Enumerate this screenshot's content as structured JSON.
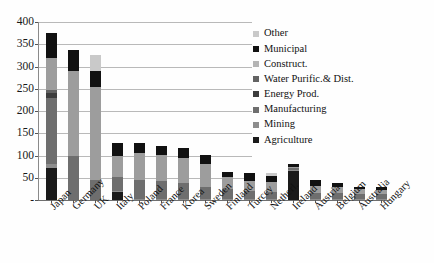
{
  "chart_data": {
    "type": "bar",
    "subtype": "stacked-bar",
    "title": "",
    "xlabel": "",
    "ylabel": "",
    "ylim": [
      0,
      400
    ],
    "ytick_step": 50,
    "yticks": [
      "400",
      "350",
      "300",
      "250",
      "200",
      "150",
      "100",
      "50",
      "-"
    ],
    "grid": true,
    "legend_position": "right",
    "categories": [
      "Japan",
      "Germany",
      "UK",
      "Italy",
      "Poland",
      "France",
      "Korea",
      "Sweden",
      "Finland",
      "Turcey",
      "Netherl.",
      "Ireland",
      "Austria",
      "Belgium",
      "Australia",
      "Hungary"
    ],
    "series": [
      {
        "name": "Agriculture",
        "color": "#1a1a1a",
        "values": [
          72,
          0,
          0,
          18,
          0,
          0,
          0,
          0,
          0,
          0,
          0,
          66,
          0,
          0,
          0,
          0
        ]
      },
      {
        "name": "Mining",
        "color": "#8d8d8d",
        "values": [
          8,
          0,
          0,
          2,
          2,
          2,
          2,
          2,
          2,
          2,
          2,
          2,
          2,
          2,
          2,
          2
        ]
      },
      {
        "name": "Manufacturing",
        "color": "#6e6e6e",
        "values": [
          150,
          100,
          45,
          32,
          42,
          40,
          36,
          28,
          22,
          18,
          16,
          4,
          14,
          14,
          12,
          12
        ]
      },
      {
        "name": "Energy Prod.",
        "color": "#3d3d3d",
        "values": [
          10,
          0,
          0,
          0,
          0,
          0,
          0,
          0,
          0,
          0,
          0,
          0,
          0,
          0,
          0,
          0
        ]
      },
      {
        "name": "Water Purific.& Dist.",
        "color": "#636363",
        "values": [
          8,
          0,
          0,
          0,
          0,
          0,
          0,
          0,
          0,
          0,
          0,
          0,
          0,
          0,
          0,
          0
        ]
      },
      {
        "name": "Construct.",
        "color": "#9d9d9d",
        "values": [
          72,
          190,
          210,
          48,
          62,
          60,
          56,
          50,
          28,
          22,
          22,
          2,
          16,
          14,
          10,
          8
        ]
      },
      {
        "name": "Municipal",
        "color": "#111111",
        "values": [
          55,
          48,
          35,
          28,
          22,
          20,
          24,
          22,
          12,
          18,
          14,
          6,
          12,
          8,
          6,
          8
        ]
      },
      {
        "name": "Other",
        "color": "#c9c9c9",
        "values": [
          0,
          0,
          35,
          0,
          0,
          0,
          0,
          0,
          0,
          0,
          6,
          0,
          0,
          0,
          0,
          0
        ]
      }
    ],
    "totals": [
      375,
      338,
      325,
      128,
      128,
      122,
      118,
      102,
      64,
      60,
      60,
      80,
      44,
      38,
      30,
      30
    ]
  },
  "legend": {
    "items": [
      {
        "label": "Other",
        "color": "#c9c9c9"
      },
      {
        "label": "Municipal",
        "color": "#111111"
      },
      {
        "label": "Construct.",
        "color": "#b5b5b5"
      },
      {
        "label": "Water Purific.& Dist.",
        "color": "#636363"
      },
      {
        "label": "Energy Prod.",
        "color": "#3d3d3d"
      },
      {
        "label": "Manufacturing",
        "color": "#6e6e6e"
      },
      {
        "label": "Mining",
        "color": "#8d8d8d"
      },
      {
        "label": "Agriculture",
        "color": "#1a1a1a"
      }
    ]
  },
  "side_note": {
    "line1": "",
    "line2": "",
    "line3": ""
  }
}
